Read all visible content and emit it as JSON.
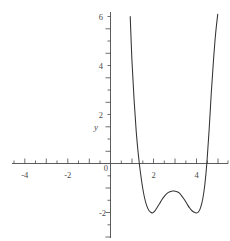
{
  "chart_data": {
    "type": "line",
    "title": "",
    "subtitle": "",
    "xlabel": "",
    "ylabel": "y",
    "xlim": [
      -5.55,
      5.2
    ],
    "ylim": [
      -3.1,
      6.2
    ],
    "grid": false,
    "legend": null,
    "x_ticks": [
      -5,
      -4,
      -3,
      -2,
      -1,
      0,
      1,
      2,
      3,
      4,
      5
    ],
    "x_tick_labels": [
      "",
      "-4",
      "",
      "-2",
      "",
      "0",
      "",
      "2",
      "",
      "4",
      ""
    ],
    "x_minor_tick_step": 0.5,
    "y_ticks": [
      -3,
      -2,
      -1,
      0,
      1,
      2,
      3,
      4,
      5,
      6
    ],
    "y_tick_labels": [
      "",
      "-2",
      "",
      "0",
      "",
      "2",
      "",
      "4",
      "",
      "6"
    ],
    "y_minor_tick_step": 0.5,
    "series": [
      {
        "name": "quartic",
        "color": "#333333",
        "x": [
          0.92,
          1.0,
          1.1,
          1.2,
          1.3,
          1.4,
          1.5,
          1.6,
          1.7,
          1.8,
          1.9,
          1.95,
          2.0,
          2.1,
          2.2,
          2.3,
          2.4,
          2.5,
          2.6,
          2.7,
          2.8,
          2.9,
          3.0,
          3.1,
          3.2,
          3.3,
          3.4,
          3.5,
          3.6,
          3.7,
          3.8,
          3.9,
          4.0,
          4.1,
          4.2,
          4.3,
          4.4,
          4.5,
          4.6,
          4.7,
          4.8,
          4.9,
          5.0
        ],
        "y": [
          6.0,
          4.2,
          2.6,
          1.3,
          0.35,
          -0.4,
          -1.0,
          -1.45,
          -1.75,
          -1.93,
          -2.0,
          -2.02,
          -2.0,
          -1.9,
          -1.76,
          -1.62,
          -1.47,
          -1.35,
          -1.25,
          -1.18,
          -1.14,
          -1.12,
          -1.13,
          -1.15,
          -1.2,
          -1.3,
          -1.42,
          -1.55,
          -1.7,
          -1.83,
          -1.93,
          -1.99,
          -2.02,
          -1.98,
          -1.8,
          -1.45,
          -0.85,
          0.1,
          1.4,
          2.9,
          4.2,
          5.3,
          6.1
        ]
      }
    ],
    "annotations": {
      "minima": [
        {
          "x": 1.95,
          "y": -2.02
        },
        {
          "x": 4.0,
          "y": -2.02
        }
      ],
      "local_max": {
        "x": 2.9,
        "y": -1.12
      },
      "x_intercepts": [
        1.35,
        4.48
      ]
    }
  },
  "labels": {
    "y_axis_name": "y",
    "x_neg_4": "-4",
    "x_neg_2": "-2",
    "x_pos_2": "2",
    "x_pos_4": "4",
    "y_6": "6",
    "y_4": "4",
    "y_2": "2",
    "y_0": "0",
    "y_neg_2": "-2"
  },
  "colors": {
    "curve": "#333333",
    "axis": "#4a4a4a",
    "background": "#ffffff"
  }
}
